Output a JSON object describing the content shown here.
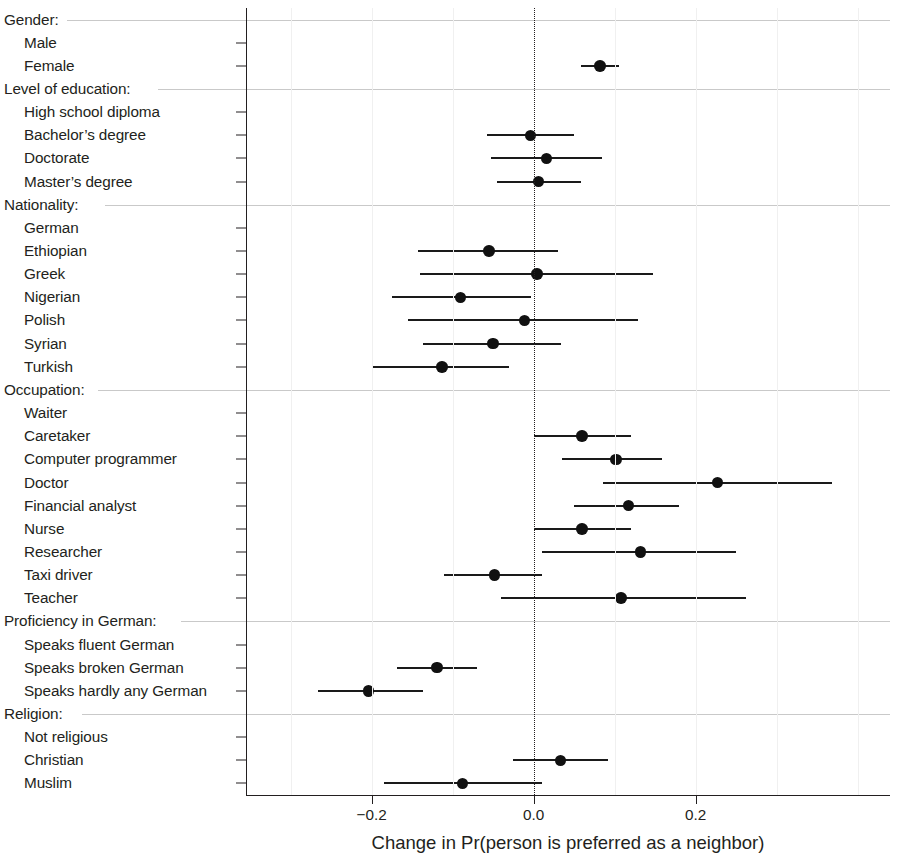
{
  "chart_data": {
    "type": "scatter",
    "title": "",
    "xlabel": "Change in Pr(person is preferred as a neighbor)",
    "ylabel": "",
    "xlim": [
      -0.355,
      0.44
    ],
    "xticks": [
      -0.2,
      0.0,
      0.2
    ],
    "xticklabels": [
      "−0.2",
      "0.0",
      "0.2"
    ],
    "grid": false,
    "zero_reference_line": 0.0,
    "point_color": "#111111",
    "line_color": "#1a1a1a",
    "rows": [
      {
        "kind": "group",
        "label": "Gender:"
      },
      {
        "kind": "item",
        "label": "Male",
        "estimate": null,
        "lo": null,
        "hi": null
      },
      {
        "kind": "item",
        "label": "Female",
        "estimate": 0.082,
        "lo": 0.058,
        "hi": 0.106
      },
      {
        "kind": "group",
        "label": "Level of education:"
      },
      {
        "kind": "item",
        "label": "High school diploma",
        "estimate": null,
        "lo": null,
        "hi": null
      },
      {
        "kind": "item",
        "label": "Bachelor’s degree",
        "estimate": -0.004,
        "lo": -0.058,
        "hi": 0.05
      },
      {
        "kind": "item",
        "label": "Doctorate",
        "estimate": 0.016,
        "lo": -0.053,
        "hi": 0.085
      },
      {
        "kind": "item",
        "label": "Master’s degree",
        "estimate": 0.006,
        "lo": -0.045,
        "hi": 0.058
      },
      {
        "kind": "group",
        "label": "Nationality:"
      },
      {
        "kind": "item",
        "label": "German",
        "estimate": null,
        "lo": null,
        "hi": null
      },
      {
        "kind": "item",
        "label": "Ethiopian",
        "estimate": -0.055,
        "lo": -0.143,
        "hi": 0.03
      },
      {
        "kind": "item",
        "label": "Greek",
        "estimate": 0.004,
        "lo": -0.14,
        "hi": 0.148
      },
      {
        "kind": "item",
        "label": "Nigerian",
        "estimate": -0.09,
        "lo": -0.175,
        "hi": -0.003
      },
      {
        "kind": "item",
        "label": "Polish",
        "estimate": -0.011,
        "lo": -0.155,
        "hi": 0.129
      },
      {
        "kind": "item",
        "label": "Syrian",
        "estimate": -0.05,
        "lo": -0.136,
        "hi": 0.034
      },
      {
        "kind": "item",
        "label": "Turkish",
        "estimate": -0.113,
        "lo": -0.198,
        "hi": -0.03
      },
      {
        "kind": "group",
        "label": "Occupation:"
      },
      {
        "kind": "item",
        "label": "Waiter",
        "estimate": null,
        "lo": null,
        "hi": null
      },
      {
        "kind": "item",
        "label": "Caretaker",
        "estimate": 0.06,
        "lo": 0.0,
        "hi": 0.12
      },
      {
        "kind": "item",
        "label": "Computer programmer",
        "estimate": 0.102,
        "lo": 0.035,
        "hi": 0.158
      },
      {
        "kind": "item",
        "label": "Doctor",
        "estimate": 0.227,
        "lo": 0.086,
        "hi": 0.369
      },
      {
        "kind": "item",
        "label": "Financial analyst",
        "estimate": 0.117,
        "lo": 0.05,
        "hi": 0.18
      },
      {
        "kind": "item",
        "label": "Nurse",
        "estimate": 0.06,
        "lo": 0.0,
        "hi": 0.12
      },
      {
        "kind": "item",
        "label": "Researcher",
        "estimate": 0.132,
        "lo": 0.01,
        "hi": 0.25
      },
      {
        "kind": "item",
        "label": "Taxi driver",
        "estimate": -0.048,
        "lo": -0.11,
        "hi": 0.011
      },
      {
        "kind": "item",
        "label": "Teacher",
        "estimate": 0.108,
        "lo": -0.04,
        "hi": 0.262
      },
      {
        "kind": "group",
        "label": "Proficiency in German:"
      },
      {
        "kind": "item",
        "label": "Speaks fluent German",
        "estimate": null,
        "lo": null,
        "hi": null
      },
      {
        "kind": "item",
        "label": "Speaks broken German",
        "estimate": -0.119,
        "lo": -0.169,
        "hi": -0.07
      },
      {
        "kind": "item",
        "label": "Speaks hardly any German",
        "estimate": -0.204,
        "lo": -0.266,
        "hi": -0.137
      },
      {
        "kind": "group",
        "label": "Religion:"
      },
      {
        "kind": "item",
        "label": "Not religious",
        "estimate": null,
        "lo": null,
        "hi": null
      },
      {
        "kind": "item",
        "label": "Christian",
        "estimate": 0.033,
        "lo": -0.026,
        "hi": 0.092
      },
      {
        "kind": "item",
        "label": "Muslim",
        "estimate": -0.088,
        "lo": -0.185,
        "hi": 0.01
      }
    ]
  }
}
